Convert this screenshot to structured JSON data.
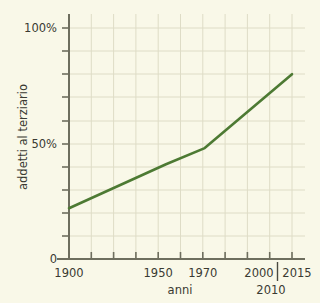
{
  "chart_data": {
    "type": "line",
    "title": "",
    "xlabel": "anni",
    "ylabel": "addetti al terziario",
    "x": [
      1900,
      1950,
      1970,
      2015
    ],
    "values": [
      22,
      41,
      48,
      80
    ],
    "series": [
      {
        "name": "addetti al terziario",
        "points": [
          {
            "x": 1900,
            "y": 22
          },
          {
            "x": 1950,
            "y": 41
          },
          {
            "x": 1970,
            "y": 48
          },
          {
            "x": 2015,
            "y": 80
          }
        ]
      }
    ],
    "xlim": [
      1900,
      2015
    ],
    "ylim": [
      0,
      115
    ],
    "x_tick_labels": [
      "1900",
      "1950",
      "1970",
      "2000",
      "2010",
      "2015"
    ],
    "y_tick_labels": [
      "0",
      "50%",
      "100%"
    ],
    "grid": true,
    "legend": "none",
    "line_color": "#4d7a33",
    "axis_color": "#6e6e5e",
    "grid_color": "#d9d8c4",
    "background_color": "#f9f8e8",
    "text_color": "#3a3a32"
  },
  "axes": {
    "y_label": "addetti al terziario",
    "x_label": "anni",
    "y_ticks": [
      {
        "label": "100%",
        "value": 100
      },
      {
        "label": "50%",
        "value": 50
      },
      {
        "label": "0",
        "value": 0
      }
    ],
    "x_ticks": [
      {
        "label": "1900",
        "value": 1900
      },
      {
        "label": "1950",
        "value": 1950
      },
      {
        "label": "1970",
        "value": 1970
      },
      {
        "label": "2000",
        "value": 2000
      },
      {
        "label": "2010",
        "value": 2010
      },
      {
        "label": "2015",
        "value": 2015
      }
    ]
  }
}
